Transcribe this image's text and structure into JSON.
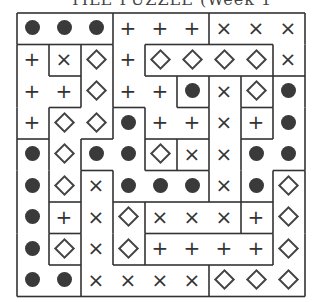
{
  "header": {
    "partial_title": "TILE PUZZLE (Week 1"
  },
  "puzzle": {
    "rows": 9,
    "cols": 9,
    "symbols_legend": {
      "O": "dot",
      "+": "plus",
      "X": "cross",
      "D": "diamond"
    },
    "grid": [
      [
        "O",
        "O",
        "O",
        "+",
        "+",
        "+",
        "X",
        "X",
        "X"
      ],
      [
        "+",
        "X",
        "D",
        "+",
        "D",
        "D",
        "D",
        "D",
        "X"
      ],
      [
        "+",
        "+",
        "D",
        "+",
        "+",
        "O",
        "X",
        "D",
        "O"
      ],
      [
        "+",
        "D",
        "D",
        "O",
        "+",
        "+",
        "X",
        "+",
        "O"
      ],
      [
        "O",
        "D",
        "O",
        "O",
        "D",
        "X",
        "X",
        "O",
        "O"
      ],
      [
        "O",
        "D",
        "X",
        "O",
        "O",
        "O",
        "X",
        "O",
        "D"
      ],
      [
        "O",
        "+",
        "X",
        "D",
        "X",
        "X",
        "X",
        "+",
        "D"
      ],
      [
        "O",
        "D",
        "X",
        "D",
        "+",
        "+",
        "+",
        "+",
        "D"
      ],
      [
        "O",
        "O",
        "X",
        "X",
        "X",
        "X",
        "D",
        "D",
        "D"
      ]
    ],
    "regions": [
      [
        "A",
        "A",
        "A",
        "B",
        "B",
        "B",
        "C",
        "C",
        "C"
      ],
      [
        "D",
        "E",
        "F",
        "B",
        "G",
        "G",
        "G",
        "G",
        "C"
      ],
      [
        "D",
        "D",
        "F",
        "B",
        "B",
        "H",
        "I",
        "J",
        "K"
      ],
      [
        "D",
        "F",
        "F",
        "L",
        "B",
        "B",
        "I",
        "M",
        "K"
      ],
      [
        "N",
        "F",
        "L",
        "L",
        "O",
        "P",
        "I",
        "K",
        "K"
      ],
      [
        "N",
        "F",
        "Q",
        "L",
        "L",
        "L",
        "I",
        "K",
        "R"
      ],
      [
        "N",
        "S",
        "Q",
        "T",
        "U",
        "U",
        "U",
        "V",
        "R"
      ],
      [
        "N",
        "W",
        "Q",
        "T",
        "X",
        "X",
        "X",
        "X",
        "R"
      ],
      [
        "N",
        "N",
        "Q",
        "Q",
        "Q",
        "Q",
        "R",
        "R",
        "R"
      ]
    ]
  }
}
